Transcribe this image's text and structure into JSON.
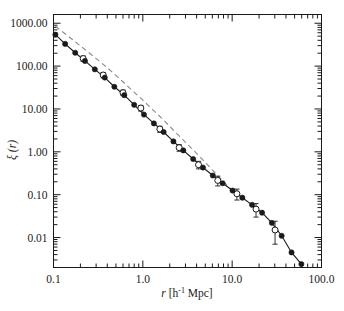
{
  "figure": {
    "background": "#ffffff",
    "axes_color": "#1a1a1a",
    "data_color": "#1a1a1a",
    "dashed_color": "#8a8a8a"
  },
  "axis": {
    "x_title_parts": {
      "var": "r",
      "open": " [h",
      "exp": "-1",
      "close": " Mpc]"
    },
    "y_title_parts": {
      "sym": "ξ",
      "arg": "(r)"
    },
    "x_tick_labels": [
      "0.1",
      "1.0",
      "10.0",
      "100.0"
    ],
    "y_tick_labels": [
      "1000.00",
      "100.00",
      "10.00",
      "1.00",
      "0.10",
      "0.01"
    ]
  },
  "chart_data": {
    "type": "line",
    "title": "",
    "xlabel": "r [h^-1 Mpc]",
    "ylabel": "xi (r)",
    "xscale": "log",
    "yscale": "log",
    "xlim": [
      0.1,
      100.0
    ],
    "ylim": [
      0.002,
      1600.0
    ],
    "xticks": [
      0.1,
      1.0,
      10.0,
      100.0
    ],
    "yticks": [
      1000.0,
      100.0,
      10.0,
      1.0,
      0.1,
      0.01
    ],
    "grid": false,
    "legend": null,
    "series": [
      {
        "name": "correlation-function-filled",
        "style": "solid-line-with-filled-circles",
        "marker": "filled-circle",
        "x": [
          0.105,
          0.135,
          0.175,
          0.225,
          0.29,
          0.375,
          0.48,
          0.62,
          0.8,
          1.03,
          1.33,
          1.71,
          2.2,
          2.84,
          3.66,
          4.71,
          6.07,
          7.82,
          10.1,
          13.0,
          16.7,
          21.6,
          27.8,
          35.8,
          46.2,
          59.5
        ],
        "y": [
          540.0,
          330.0,
          205.0,
          132.0,
          84.0,
          54.0,
          33.0,
          21.0,
          12.5,
          7.4,
          4.6,
          2.9,
          1.75,
          1.08,
          0.68,
          0.43,
          0.28,
          0.185,
          0.125,
          0.085,
          0.058,
          0.038,
          0.022,
          0.011,
          0.0045,
          0.0024
        ]
      },
      {
        "name": "correlation-function-open",
        "style": "open-circles-with-errorbars",
        "marker": "open-circle",
        "x": [
          0.215,
          0.36,
          0.6,
          0.95,
          1.55,
          2.55,
          4.2,
          6.9,
          11.3,
          18.5,
          30.2
        ],
        "y": [
          150.0,
          62.0,
          24.0,
          10.5,
          3.4,
          1.25,
          0.5,
          0.215,
          0.105,
          0.046,
          0.015
        ],
        "yerr_lo": [
          22.0,
          9.0,
          3.5,
          1.6,
          0.55,
          0.22,
          0.1,
          0.055,
          0.03,
          0.016,
          0.008
        ],
        "yerr_hi": [
          22.0,
          9.0,
          3.5,
          1.6,
          0.55,
          0.22,
          0.1,
          0.055,
          0.03,
          0.016,
          0.009
        ]
      },
      {
        "name": "model-dashed",
        "style": "dashed-line",
        "marker": "none",
        "x": [
          0.105,
          0.16,
          0.25,
          0.4,
          0.63,
          1.0,
          1.6,
          2.5,
          4.0,
          6.3,
          10.0
        ],
        "y": [
          850.0,
          430.0,
          205.0,
          92.0,
          39.0,
          16.0,
          6.3,
          2.45,
          0.92,
          0.34,
          0.125
        ]
      }
    ]
  }
}
